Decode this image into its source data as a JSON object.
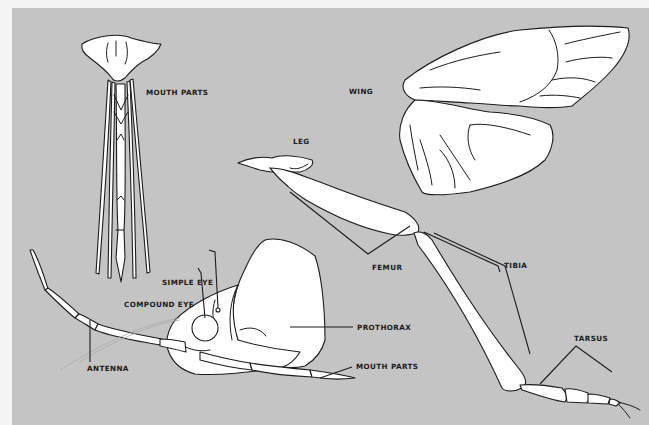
{
  "figure": {
    "background_color": "#c4c4c4",
    "border_color": "#f4f4f4",
    "line_color": "#1c1c1c",
    "fill_color": "#ffffff"
  },
  "labels": {
    "mouth_parts_top": "MOUTH PARTS",
    "wing": "WING",
    "leg": "LEG",
    "femur": "FEMUR",
    "tibia": "TIBIA",
    "tarsus": "TARSUS",
    "simple_eye": "SIMPLE EYE",
    "compound_eye": "COMPOUND EYE",
    "prothorax": "PROTHORAX",
    "antenna": "ANTENNA",
    "mouth_parts_head": "MOUTH PARTS"
  }
}
